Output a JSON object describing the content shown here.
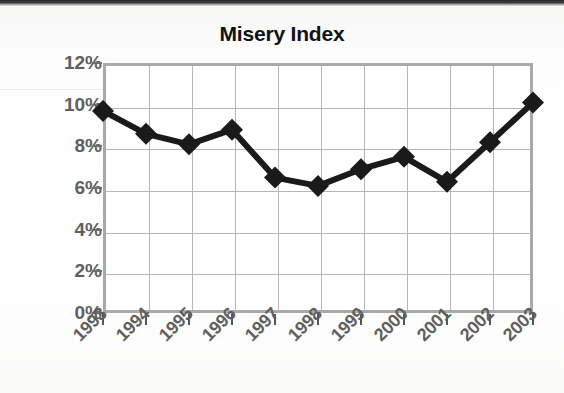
{
  "chart_data": {
    "type": "line",
    "title": "Misery Index",
    "xlabel": "",
    "ylabel": "",
    "categories": [
      "1993",
      "1994",
      "1995",
      "1996",
      "1997",
      "1998",
      "1999",
      "2000",
      "2001",
      "2002",
      "2003"
    ],
    "values": [
      9.7,
      8.6,
      8.1,
      8.8,
      6.5,
      6.1,
      6.9,
      7.5,
      6.3,
      8.2,
      10.1
    ],
    "ytick_labels": [
      "0%",
      "2%",
      "4%",
      "6%",
      "8%",
      "10%",
      "12%"
    ],
    "ytick_values": [
      0,
      2,
      4,
      6,
      8,
      10,
      12
    ],
    "ylim": [
      0,
      12
    ],
    "grid": "both",
    "legend": "none",
    "marker": "diamond",
    "series_color": "#1a1a1a",
    "grid_color": "#b6b6b6",
    "frame_color": "#a9a9a9",
    "label_color": "#5f5f5f",
    "title_color": "#111111"
  }
}
